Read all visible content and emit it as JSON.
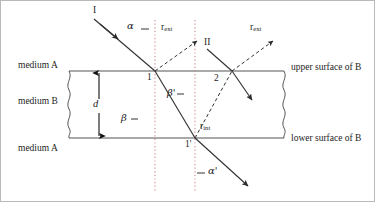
{
  "figure": {
    "type": "optics-ray-diagram"
  },
  "labels": {
    "medium_a_top": "medium A",
    "medium_b": "medium B",
    "medium_a_bottom": "medium A",
    "upper_surface": "upper surface of B",
    "lower_surface": "lower surface of B",
    "thickness": "d",
    "ray_one": "I",
    "ray_two": "II",
    "point_one": "1",
    "point_one_prime": "1'",
    "point_two": "2",
    "angle_alpha": "α",
    "angle_alpha_prime": "α'",
    "angle_beta": "β",
    "angle_beta_prime": "β'",
    "r_ext_left_main": "r",
    "r_ext_left_sub": "ext",
    "r_ext_right_main": "r",
    "r_ext_right_sub": "ext",
    "r_int_main": "r",
    "r_int_sub": "int"
  },
  "colors": {
    "ink": "#1d1d1d",
    "line": "#4a4a4a",
    "surface": "#555555",
    "normal_dotted": "#d08a8a",
    "background": "#ffffff",
    "border": "#b9b9b9"
  },
  "geometry": {
    "upper_surface_y": 70,
    "lower_surface_y": 137,
    "slab_left_x": 68,
    "slab_right_x": 283,
    "normal_1_x": 154,
    "normal_2_x": 194,
    "point_1": [
      154,
      70
    ],
    "point_1_prime": [
      194,
      137
    ],
    "point_2": [
      231,
      70
    ]
  }
}
